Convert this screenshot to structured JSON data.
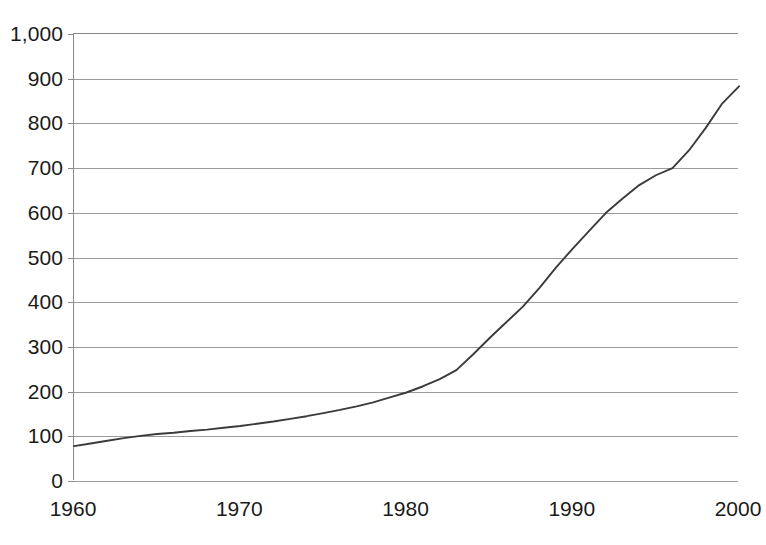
{
  "chart_data": {
    "type": "line",
    "title": "",
    "subtitle": "",
    "xlabel": "",
    "ylabel": "",
    "xlim": [
      1960,
      2000
    ],
    "ylim": [
      0,
      1000
    ],
    "grid": true,
    "legend": null,
    "x_tick_labels": [
      "1960",
      "1970",
      "1980",
      "1990",
      "2000"
    ],
    "x_ticks": [
      1960,
      1970,
      1980,
      1990,
      2000
    ],
    "y_tick_labels": [
      "0",
      "100",
      "200",
      "300",
      "400",
      "500",
      "600",
      "700",
      "800",
      "900",
      "1,000"
    ],
    "y_ticks": [
      0,
      100,
      200,
      300,
      400,
      500,
      600,
      700,
      800,
      900,
      1000
    ],
    "series": [
      {
        "name": "series-1",
        "color": "#3b3b3b",
        "x": [
          1960,
          1961,
          1962,
          1963,
          1964,
          1965,
          1966,
          1967,
          1968,
          1969,
          1970,
          1971,
          1972,
          1973,
          1974,
          1975,
          1976,
          1977,
          1978,
          1979,
          1980,
          1981,
          1982,
          1983,
          1984,
          1985,
          1986,
          1987,
          1988,
          1989,
          1990,
          1991,
          1992,
          1993,
          1994,
          1995,
          1996,
          1997,
          1998,
          1999,
          2000
        ],
        "values": [
          78,
          84,
          90,
          96,
          101,
          105,
          108,
          112,
          115,
          119,
          123,
          128,
          133,
          139,
          145,
          152,
          159,
          167,
          176,
          187,
          198,
          212,
          228,
          248,
          283,
          320,
          355,
          390,
          432,
          478,
          520,
          560,
          600,
          632,
          662,
          684,
          700,
          740,
          790,
          845,
          883
        ]
      }
    ]
  },
  "axis": {
    "y_tick_labels": [
      "1,000",
      "900",
      "800",
      "700",
      "600",
      "500",
      "400",
      "300",
      "200",
      "100",
      "0"
    ],
    "x_tick_labels": [
      "1960",
      "1970",
      "1980",
      "1990",
      "2000"
    ]
  },
  "colors": {
    "line": "#3b3b3b",
    "grid": "#9b9b9b",
    "axis": "#8a8a8a",
    "text": "#1a1a1a",
    "background": "#ffffff"
  }
}
